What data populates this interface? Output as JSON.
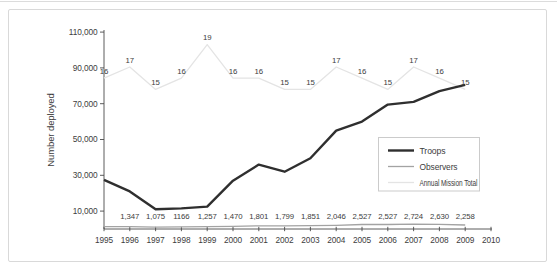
{
  "figure": {
    "y_axis_title": "Number deployed"
  },
  "legend": {
    "items": [
      {
        "label": "Troops"
      },
      {
        "label": "Observers"
      },
      {
        "label": "Annual Mission Total"
      }
    ]
  },
  "chart_data": {
    "type": "line",
    "title": "",
    "xlabel": "",
    "ylabel": "Number deployed",
    "grid": false,
    "legend_position": "middle-right-box",
    "x_years": [
      1995,
      1996,
      1997,
      1998,
      1999,
      2000,
      2001,
      2002,
      2003,
      2004,
      2005,
      2006,
      2007,
      2008,
      2009
    ],
    "x_axis_tick_labels": [
      "1995",
      "1996",
      "1997",
      "1998",
      "1999",
      "2000",
      "2001",
      "2002",
      "2003",
      "2004",
      "2005",
      "2006",
      "2007",
      "2008",
      "2009",
      "2010"
    ],
    "y_axis_tick_values": [
      10000,
      30000,
      50000,
      70000,
      90000,
      110000
    ],
    "y_axis_tick_labels": [
      "10,000",
      "30,000",
      "50,000",
      "70,000",
      "90,000",
      "110,000"
    ],
    "ylim": [
      0,
      115000
    ],
    "series": [
      {
        "name": "Troops",
        "color": "#2f2f2f",
        "stroke_width": 2.4,
        "axis": "primary",
        "label_placement": "none",
        "values": [
          27500,
          21000,
          11000,
          11500,
          12500,
          27000,
          36000,
          32000,
          39500,
          55000,
          60000,
          69500,
          71000,
          77000,
          80500
        ],
        "data_labels": []
      },
      {
        "name": "Observers",
        "color": "#a3a3a3",
        "stroke_width": 1.3,
        "axis": "primary",
        "label_placement": "row",
        "values": [
          1300,
          1347,
          1075,
          1166,
          1257,
          1470,
          1801,
          1799,
          1851,
          2046,
          2527,
          2527,
          2724,
          2630,
          2258
        ],
        "data_labels": [
          "",
          "1,347",
          "1,075",
          "1166",
          "1,257",
          "1,470",
          "1,801",
          "1,799",
          "1,851",
          "2,046",
          "2,527",
          "2,527",
          "2,724",
          "2,630",
          "2,258"
        ]
      },
      {
        "name": "Annual Mission Total",
        "color": "#e4e4e4",
        "stroke_width": 1.3,
        "axis": "secondary_hidden",
        "label_placement": "above",
        "values": [
          16,
          17,
          15,
          16,
          19,
          16,
          16,
          15,
          15,
          17,
          16,
          15,
          17,
          16,
          15
        ],
        "data_labels": [
          "16",
          "17",
          "15",
          "16",
          "19",
          "16",
          "16",
          "15",
          "15",
          "17",
          "16",
          "15",
          "17",
          "16",
          "15"
        ]
      }
    ],
    "secondary_axis_map": {
      "scale": 6250,
      "offset": -15750
    }
  }
}
